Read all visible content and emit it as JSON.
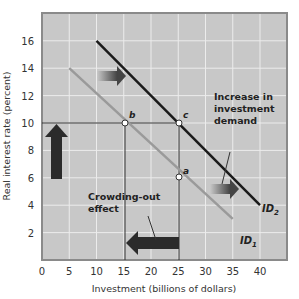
{
  "chart_data": {
    "type": "line",
    "title": "",
    "xlabel": "Investment (billions of dollars)",
    "ylabel": "Real interest rate (percent)",
    "xlim": [
      0,
      44
    ],
    "ylim": [
      0,
      18
    ],
    "x_ticks": [
      0,
      5,
      10,
      15,
      20,
      25,
      30,
      35,
      40
    ],
    "y_ticks": [
      2,
      4,
      6,
      8,
      10,
      12,
      14,
      16
    ],
    "grid": true,
    "background": "#c8c8c8",
    "series": [
      {
        "name": "ID1",
        "label_main": "ID",
        "label_sub": "1",
        "color": "#9a9a9a",
        "points": [
          [
            5,
            14
          ],
          [
            35,
            3
          ]
        ]
      },
      {
        "name": "ID2",
        "label_main": "ID",
        "label_sub": "2",
        "color": "#1a1a1a",
        "points": [
          [
            10,
            16
          ],
          [
            40,
            4
          ]
        ]
      }
    ],
    "points": [
      {
        "label": "a",
        "x": 25,
        "y": 6.3
      },
      {
        "label": "b",
        "x": 15,
        "y": 10
      },
      {
        "label": "c",
        "x": 25,
        "y": 10
      }
    ],
    "annotations": [
      {
        "text_lines": [
          "Increase in",
          "investment",
          "demand"
        ]
      },
      {
        "text_lines": [
          "Crowding-out",
          "effect"
        ]
      }
    ]
  }
}
